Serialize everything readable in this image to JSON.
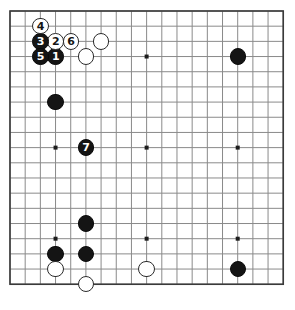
{
  "diagram": {
    "board_size": 19,
    "board_color": "#ffffff",
    "line_color": "#8a8a8a",
    "border_color": "#3a3a3a",
    "black_color": "#141414",
    "white_color": "#ffffff",
    "geometry": {
      "origin_x": 10,
      "origin_y": 11,
      "spacing": 15.18,
      "stone_radius": 8.2,
      "star_radius": 2.0
    },
    "star_points": [
      {
        "col": 3,
        "row": 3
      },
      {
        "col": 9,
        "row": 3
      },
      {
        "col": 15,
        "row": 3
      },
      {
        "col": 3,
        "row": 9
      },
      {
        "col": 9,
        "row": 9
      },
      {
        "col": 15,
        "row": 9
      },
      {
        "col": 3,
        "row": 15
      },
      {
        "col": 9,
        "row": 15
      },
      {
        "col": 15,
        "row": 15
      }
    ],
    "stones": [
      {
        "id": "move-1",
        "color": "black",
        "col": 3,
        "row": 3,
        "label": "1"
      },
      {
        "id": "move-2",
        "color": "white",
        "col": 3,
        "row": 2,
        "label": "2"
      },
      {
        "id": "move-3",
        "color": "black",
        "col": 2,
        "row": 2,
        "label": "3"
      },
      {
        "id": "move-4",
        "color": "white",
        "col": 2,
        "row": 1,
        "label": "4"
      },
      {
        "id": "move-5",
        "color": "black",
        "col": 2,
        "row": 3,
        "label": "5"
      },
      {
        "id": "move-6",
        "color": "white",
        "col": 4,
        "row": 2,
        "label": "6"
      },
      {
        "id": "move-7",
        "color": "black",
        "col": 5,
        "row": 9,
        "label": "7"
      },
      {
        "id": "white-upper-left-wing",
        "color": "white",
        "col": 5,
        "row": 3,
        "label": ""
      },
      {
        "id": "white-upper-side",
        "color": "white",
        "col": 6,
        "row": 2,
        "label": ""
      },
      {
        "id": "black-left-upper",
        "color": "black",
        "col": 3,
        "row": 6,
        "label": ""
      },
      {
        "id": "black-upper-right-star",
        "color": "black",
        "col": 15,
        "row": 3,
        "label": ""
      },
      {
        "id": "black-left-lower",
        "color": "black",
        "col": 5,
        "row": 14,
        "label": ""
      },
      {
        "id": "black-corner-upper-a",
        "color": "black",
        "col": 3,
        "row": 16,
        "label": ""
      },
      {
        "id": "black-corner-upper-b",
        "color": "black",
        "col": 5,
        "row": 16,
        "label": ""
      },
      {
        "id": "white-corner-left",
        "color": "white",
        "col": 3,
        "row": 17,
        "label": ""
      },
      {
        "id": "white-corner-below",
        "color": "white",
        "col": 5,
        "row": 18,
        "label": ""
      },
      {
        "id": "white-bottom-side",
        "color": "white",
        "col": 9,
        "row": 17,
        "label": ""
      },
      {
        "id": "black-lower-right-star",
        "color": "black",
        "col": 15,
        "row": 17,
        "label": ""
      }
    ],
    "move_sequence": [
      "1",
      "2",
      "3",
      "4",
      "5",
      "6",
      "7"
    ]
  }
}
